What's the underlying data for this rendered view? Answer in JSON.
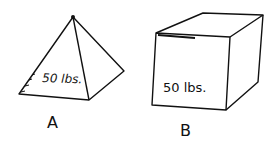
{
  "figures": [
    {
      "id": "A",
      "shape": "pyramid",
      "weight_label": "50 lbs.",
      "caption": "A"
    },
    {
      "id": "B",
      "shape": "rectangular-box",
      "weight_label": "50 lbs.",
      "caption": "B"
    }
  ],
  "colors": {
    "ink": "#111111",
    "background": "#ffffff"
  }
}
